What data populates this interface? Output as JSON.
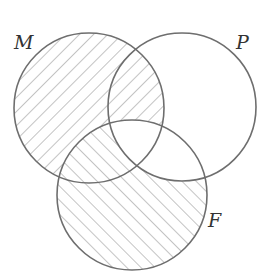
{
  "diagram": {
    "type": "venn",
    "sets": [
      {
        "id": "M",
        "label": "M",
        "cx": 89,
        "cy": 108,
        "r": 75
      },
      {
        "id": "P",
        "label": "P",
        "cx": 182,
        "cy": 107,
        "r": 74
      },
      {
        "id": "F",
        "label": "F",
        "cx": 132,
        "cy": 195,
        "r": 75
      }
    ],
    "shaded_regions": [
      {
        "region": "M only",
        "hatch": "down-right"
      },
      {
        "region": "M ∩ P (not F)",
        "hatch": "down-right"
      },
      {
        "region": "M ∩ F (not P)",
        "hatch": "up-right"
      },
      {
        "region": "F only",
        "hatch": "up-right"
      }
    ],
    "unshaded_regions": [
      "P only",
      "P ∩ F (not M)",
      "M ∩ P ∩ F"
    ],
    "colors": {
      "outline": "#6e6e6e",
      "hatch": "#8a8a8a",
      "background": "#ffffff"
    }
  },
  "labels": {
    "m": "M",
    "p": "P",
    "f": "F"
  }
}
